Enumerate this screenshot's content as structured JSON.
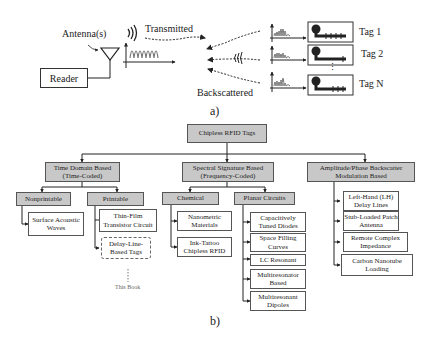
{
  "part_a": {
    "caption": "a)",
    "reader_label": "Reader",
    "antenna_label": "Antenna(s)",
    "transmitted_label": "Transmitted",
    "backscattered_label": "Backscattered",
    "tags": [
      {
        "label": "Tag 1"
      },
      {
        "label": "Tag 2"
      },
      {
        "label": "Tag N"
      }
    ],
    "ellipsis": "⋮"
  },
  "part_b": {
    "caption": "b)",
    "root": "Chipless RFID Tags",
    "branches": [
      {
        "title_line1": "Time Domain Based",
        "title_line2": "(Time-Coded)",
        "children": [
          {
            "title": "Nonprintable",
            "leaves": [
              "Surface Acoustic Waves"
            ]
          },
          {
            "title": "Printable",
            "leaves": [
              "Thin-Film Transistor Circuit",
              "Delay-Line-Based Tags"
            ]
          }
        ]
      },
      {
        "title_line1": "Spectral Signature Based",
        "title_line2": "(Frequency-Coded)",
        "children": [
          {
            "title": "Chemical",
            "leaves": [
              "Nanometric Materials",
              "Ink-Tattoo Chipless RFID"
            ]
          },
          {
            "title": "Planar Circuits",
            "leaves": [
              "Capacitively Tuned Diodes",
              "Space Filling Curves",
              "LC Resonant",
              "Multiresonator Based",
              "Multiresonant Dipoles"
            ]
          }
        ]
      },
      {
        "title_line1": "Amplitude/Phase Backscatter",
        "title_line2": "Modulation Based",
        "leaves": [
          "Left-Hand (LH) Delay Lines",
          "Stub-Loaded Patch Antenna",
          "Remote Complex Impedance",
          "Carbon Nanotube Loading"
        ]
      }
    ],
    "this_book_note": "This Book"
  }
}
